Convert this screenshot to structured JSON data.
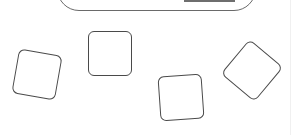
{
  "canvas": {
    "background": "#ffffff",
    "stroke_color": "#4a4a4a"
  },
  "frame": {
    "accent_bar_color": "#6e6e6e"
  },
  "tiles": [
    {
      "id": 1,
      "center_x": 37,
      "center_y": 74,
      "rotation_deg": 10
    },
    {
      "id": 2,
      "center_x": 110,
      "center_y": 53,
      "rotation_deg": 0
    },
    {
      "id": 3,
      "center_x": 181,
      "center_y": 97,
      "rotation_deg": -4
    },
    {
      "id": 4,
      "center_x": 252,
      "center_y": 70,
      "rotation_deg": 40
    }
  ]
}
